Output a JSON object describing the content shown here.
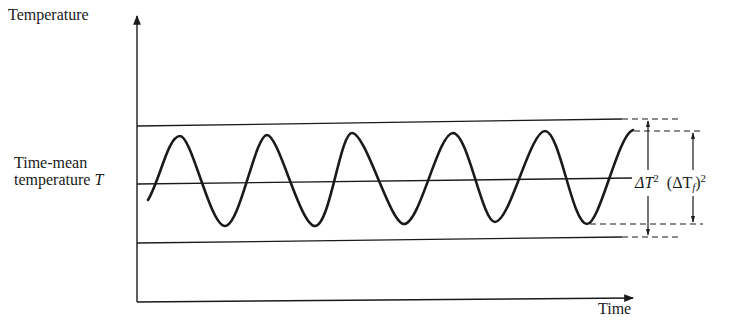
{
  "diagram": {
    "type": "time-series schematic",
    "y_axis_label": "Temperature",
    "x_axis_label": "Time",
    "mean_label_line1": "Time-mean",
    "mean_label_line2": "temperature",
    "mean_symbol": "T",
    "range_label_total": "ΔT",
    "range_label_total_exp": "2",
    "range_label_fluct_open": "(ΔT",
    "range_label_fluct_sub": "f",
    "range_label_fluct_close": ")",
    "range_label_fluct_exp": "2",
    "colors": {
      "ink": "#1a1a1a",
      "background": "#ffffff"
    },
    "wave": {
      "description": "Oscillating temperature around time-mean T with ~5 peaks and ~5 troughs",
      "peaks_count": 5,
      "troughs_count": 5
    }
  }
}
